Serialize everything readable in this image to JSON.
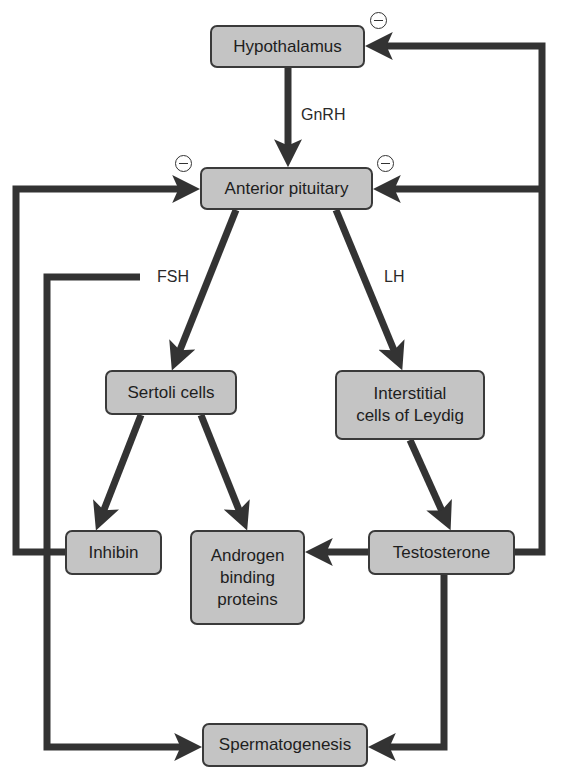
{
  "nodes": {
    "hypothalamus": {
      "label": "Hypothalamus",
      "x": 210,
      "y": 25,
      "w": 155,
      "h": 43
    },
    "anterior_pituitary": {
      "label": "Anterior pituitary",
      "x": 200,
      "y": 167,
      "w": 173,
      "h": 43
    },
    "sertoli_cells": {
      "label": "Sertoli cells",
      "x": 105,
      "y": 370,
      "w": 132,
      "h": 45
    },
    "leydig_cells": {
      "label": "Interstitial\ncells of Leydig",
      "x": 335,
      "y": 370,
      "w": 150,
      "h": 70
    },
    "inhibin": {
      "label": "Inhibin",
      "x": 65,
      "y": 530,
      "w": 97,
      "h": 45
    },
    "androgen_binding_proteins": {
      "label": "Androgen\nbinding\nproteins",
      "x": 190,
      "y": 530,
      "w": 115,
      "h": 95
    },
    "testosterone": {
      "label": "Testosterone",
      "x": 368,
      "y": 530,
      "w": 147,
      "h": 45
    },
    "spermatogenesis": {
      "label": "Spermatogenesis",
      "x": 202,
      "y": 723,
      "w": 166,
      "h": 44
    }
  },
  "edge_labels": {
    "gnrh": "GnRH",
    "fsh": "FSH",
    "lh": "LH"
  },
  "inhibition_marker": "⊖",
  "edges": [
    {
      "from": "hypothalamus",
      "to": "anterior_pituitary",
      "label": "GnRH",
      "type": "stimulates"
    },
    {
      "from": "anterior_pituitary",
      "to": "sertoli_cells",
      "label": "FSH",
      "type": "stimulates"
    },
    {
      "from": "anterior_pituitary",
      "to": "spermatogenesis",
      "label": "FSH",
      "type": "stimulates"
    },
    {
      "from": "anterior_pituitary",
      "to": "leydig_cells",
      "label": "LH",
      "type": "stimulates"
    },
    {
      "from": "sertoli_cells",
      "to": "inhibin",
      "type": "produces"
    },
    {
      "from": "sertoli_cells",
      "to": "androgen_binding_proteins",
      "type": "produces"
    },
    {
      "from": "leydig_cells",
      "to": "testosterone",
      "type": "produces"
    },
    {
      "from": "testosterone",
      "to": "androgen_binding_proteins",
      "type": "binds"
    },
    {
      "from": "testosterone",
      "to": "spermatogenesis",
      "type": "stimulates"
    },
    {
      "from": "inhibin",
      "to": "anterior_pituitary",
      "type": "inhibits"
    },
    {
      "from": "testosterone",
      "to": "anterior_pituitary",
      "type": "inhibits"
    },
    {
      "from": "testosterone",
      "to": "hypothalamus",
      "type": "inhibits"
    }
  ],
  "colors": {
    "node_fill": "#c4c4c4",
    "node_border": "#3a3a3a",
    "arrow": "#333333",
    "text": "#1e1e1e"
  }
}
